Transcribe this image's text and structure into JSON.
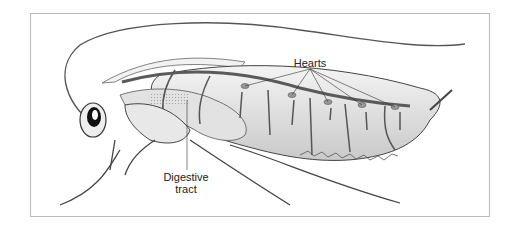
{
  "diagram": {
    "labels": {
      "hearts": "Hearts",
      "digestive_tract": "Digestive\ntract"
    },
    "colors": {
      "frame_border": "#b8b8b8",
      "dorsal_vessel": "#5a5a5a",
      "heart_chamber": "#9a9a9a",
      "body_line": "#333333",
      "shading": "#cfcfcf"
    }
  }
}
